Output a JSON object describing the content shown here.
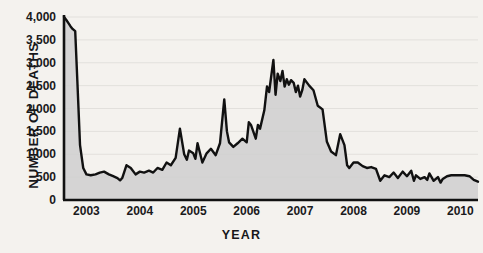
{
  "chart_data": {
    "type": "area",
    "title": "",
    "xlabel": "YEAR",
    "ylabel": "NUMBER OF DEATHS",
    "xlim": [
      2002.58,
      2010.33
    ],
    "ylim": [
      0,
      4000
    ],
    "grid": true,
    "legend": null,
    "yticks": [
      "0",
      "500",
      "1,000",
      "1,500",
      "2,000",
      "2,500",
      "3,000",
      "3,500",
      "4,000"
    ],
    "ytick_values": [
      0,
      500,
      1000,
      1500,
      2000,
      2500,
      3000,
      3500,
      4000
    ],
    "xticks": [
      "2003",
      "2004",
      "2005",
      "2006",
      "2007",
      "2008",
      "2009",
      "2010"
    ],
    "xtick_values": [
      2003,
      2004,
      2005,
      2006,
      2007,
      2008,
      2009,
      2010
    ],
    "line_color": "#111111",
    "fill_color": "#cfcfcf",
    "background_color": "#f4f2ee",
    "series": [
      {
        "name": "Number of deaths",
        "x": [
          2002.58,
          2002.62,
          2002.66,
          2002.7,
          2002.74,
          2002.79,
          2002.83,
          2002.88,
          2002.94,
          2003.0,
          2003.08,
          2003.17,
          2003.25,
          2003.33,
          2003.42,
          2003.5,
          2003.58,
          2003.63,
          2003.67,
          2003.75,
          2003.83,
          2003.92,
          2004.0,
          2004.08,
          2004.17,
          2004.25,
          2004.33,
          2004.42,
          2004.5,
          2004.58,
          2004.67,
          2004.75,
          2004.83,
          2004.88,
          2004.92,
          2005.0,
          2005.04,
          2005.08,
          2005.17,
          2005.25,
          2005.33,
          2005.42,
          2005.5,
          2005.58,
          2005.63,
          2005.67,
          2005.75,
          2005.83,
          2005.92,
          2006.0,
          2006.04,
          2006.08,
          2006.17,
          2006.21,
          2006.25,
          2006.33,
          2006.38,
          2006.42,
          2006.5,
          2006.54,
          2006.58,
          2006.63,
          2006.67,
          2006.71,
          2006.75,
          2006.79,
          2006.83,
          2006.88,
          2006.92,
          2006.96,
          2007.0,
          2007.04,
          2007.08,
          2007.17,
          2007.25,
          2007.33,
          2007.42,
          2007.5,
          2007.58,
          2007.67,
          2007.75,
          2007.83,
          2007.88,
          2007.92,
          2008.0,
          2008.08,
          2008.17,
          2008.25,
          2008.33,
          2008.42,
          2008.5,
          2008.58,
          2008.67,
          2008.75,
          2008.83,
          2008.92,
          2009.0,
          2009.08,
          2009.13,
          2009.17,
          2009.25,
          2009.33,
          2009.38,
          2009.42,
          2009.5,
          2009.58,
          2009.63,
          2009.67,
          2009.75,
          2009.83,
          2009.92,
          2010.0,
          2010.08,
          2010.17,
          2010.25,
          2010.33
        ],
        "values": [
          4000,
          3940,
          3870,
          3800,
          3740,
          3690,
          2600,
          1200,
          700,
          560,
          540,
          560,
          600,
          620,
          560,
          520,
          480,
          430,
          480,
          760,
          700,
          560,
          620,
          600,
          640,
          600,
          700,
          660,
          820,
          760,
          920,
          1560,
          1000,
          880,
          1080,
          1020,
          900,
          1240,
          820,
          1020,
          1120,
          980,
          1240,
          2200,
          1500,
          1260,
          1160,
          1240,
          1340,
          1260,
          1700,
          1640,
          1340,
          1640,
          1560,
          1960,
          2480,
          2360,
          3060,
          2300,
          2760,
          2600,
          2820,
          2480,
          2640,
          2520,
          2620,
          2560,
          2360,
          2500,
          2260,
          2400,
          2640,
          2500,
          2400,
          2060,
          1980,
          1280,
          1060,
          980,
          1440,
          1200,
          760,
          700,
          820,
          820,
          740,
          700,
          720,
          680,
          420,
          540,
          500,
          600,
          480,
          620,
          520,
          640,
          420,
          540,
          460,
          500,
          440,
          580,
          420,
          500,
          380,
          460,
          520,
          540,
          540,
          540,
          540,
          520,
          440,
          400
        ]
      }
    ]
  }
}
